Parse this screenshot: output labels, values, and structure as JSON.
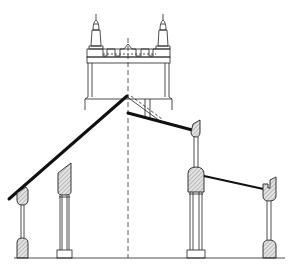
{
  "figure": {
    "type": "architectural-section",
    "subject": "Church cross-section with west tower, nave and aisles",
    "colors": {
      "line": "#222222",
      "roof": "#111111",
      "hatch": "#888888",
      "background": "#ffffff"
    },
    "elements": {
      "tower": "tower-with-crenellated-parapet-and-two-pinnacles",
      "centerline": "dashed-axis",
      "nave_roof_left": "steep-pitched-roof",
      "nave_roof_right": "low-pitched-roof-with-gutter",
      "aisle_roof_right": "lean-to-roof-with-gutter",
      "piers": [
        "left-outer-wall",
        "left-arcade-pier",
        "right-arcade-pier",
        "right-outer-wall"
      ]
    }
  }
}
